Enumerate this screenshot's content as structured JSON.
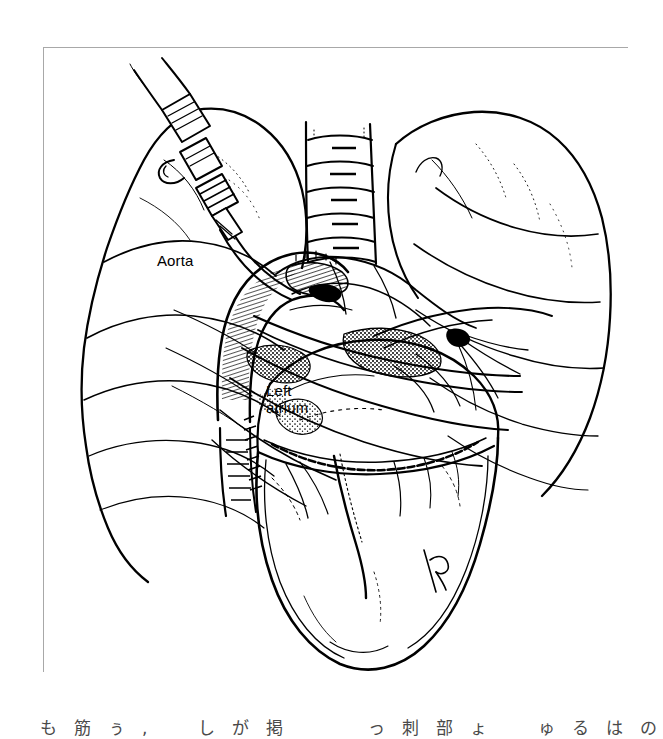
{
  "figure": {
    "domain_kind": "medical-line-illustration",
    "background_color": "#ffffff",
    "ink_color": "#000000",
    "frame_color": "#a8a8a8",
    "labels": {
      "aorta": "Aorta",
      "left_atrium": "Left\natrium"
    },
    "signature": "RD"
  },
  "caption": {
    "text": "も筋ぅ,　しが掲　　っ刺部ょ　ゅるはの"
  }
}
